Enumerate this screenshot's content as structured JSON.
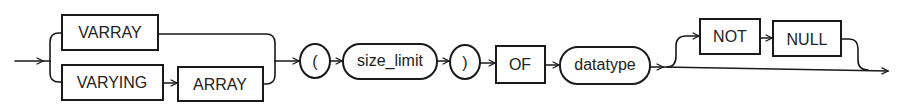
{
  "diagram": {
    "type": "railroad-syntax-diagram",
    "keywords": {
      "varray": "VARRAY",
      "varying": "VARYING",
      "array": "ARRAY",
      "of": "OF",
      "not": "NOT",
      "null": "NULL"
    },
    "symbols": {
      "open_paren": "(",
      "close_paren": ")"
    },
    "nonterminals": {
      "size_limit": "size_limit",
      "datatype": "datatype"
    },
    "colors": {
      "stroke": "#1a1a1a",
      "text": "#222222",
      "background": "#ffffff"
    }
  }
}
